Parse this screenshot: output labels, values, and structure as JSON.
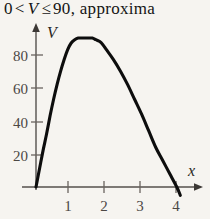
{
  "caption": {
    "parts": [
      {
        "t": "0",
        "k": "num"
      },
      {
        "t": "<",
        "k": "op"
      },
      {
        "t": "V",
        "k": "var"
      },
      {
        "t": "≤",
        "k": "op"
      },
      {
        "t": "90, approxima",
        "k": "num"
      }
    ],
    "full_text": "0 < V ≤ 90, approxima"
  },
  "colors": {
    "background": "#f6f4f0",
    "curve": "#0d0d0d",
    "axis": "#55504c",
    "tick_label": "#4c4744",
    "text": "#141414"
  },
  "chart_data": {
    "type": "line",
    "title": "",
    "xlabel": "x",
    "ylabel": "V",
    "xlim": [
      -0.2,
      4.6
    ],
    "ylim": [
      -8,
      100
    ],
    "grid": false,
    "legend": null,
    "x_ticks": [
      1,
      2,
      3,
      4
    ],
    "x_tick_labels": [
      "1",
      "2",
      "3",
      "4"
    ],
    "y_ticks": [
      20,
      40,
      60,
      80
    ],
    "y_tick_labels": [
      "20",
      "40",
      "60",
      "80"
    ],
    "axis_arrows": {
      "x": true,
      "y": true
    },
    "annotations": [],
    "series": [
      {
        "name": "V(x)",
        "x": [
          0.0,
          0.1,
          0.2,
          0.3,
          0.4,
          0.5,
          0.6,
          0.7,
          0.8,
          0.9,
          1.0,
          1.1,
          1.2,
          1.3,
          1.4,
          1.5,
          1.6,
          1.7,
          1.8,
          1.9,
          2.0,
          2.2,
          2.4,
          2.6,
          2.8,
          3.0,
          3.2,
          3.4,
          3.6,
          3.8,
          4.0,
          4.1
        ],
        "y": [
          0,
          11,
          22,
          32,
          43,
          53,
          62,
          70,
          77,
          83,
          87,
          89,
          90,
          90,
          90,
          90,
          90,
          89,
          88,
          86,
          83,
          77,
          70,
          62,
          53,
          44,
          34,
          24,
          16,
          8,
          0,
          -5
        ]
      }
    ],
    "peak": {
      "x": 1.64,
      "y": 90
    },
    "x_intercepts": [
      0,
      4
    ]
  }
}
